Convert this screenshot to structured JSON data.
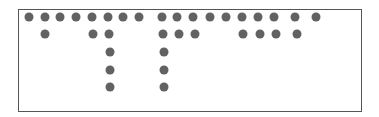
{
  "diagram": {
    "type": "dot-pattern",
    "dot_color": "#626262",
    "border_color": "#555555",
    "dots": [
      {
        "x": 29,
        "y": 17
      },
      {
        "x": 45,
        "y": 17
      },
      {
        "x": 60,
        "y": 17
      },
      {
        "x": 76,
        "y": 17
      },
      {
        "x": 92,
        "y": 17
      },
      {
        "x": 108,
        "y": 17
      },
      {
        "x": 123,
        "y": 17
      },
      {
        "x": 139,
        "y": 17
      },
      {
        "x": 162,
        "y": 17
      },
      {
        "x": 177,
        "y": 17
      },
      {
        "x": 193,
        "y": 17
      },
      {
        "x": 210,
        "y": 17
      },
      {
        "x": 226,
        "y": 17
      },
      {
        "x": 242,
        "y": 17
      },
      {
        "x": 258,
        "y": 17
      },
      {
        "x": 274,
        "y": 17
      },
      {
        "x": 295,
        "y": 17
      },
      {
        "x": 316,
        "y": 17
      },
      {
        "x": 45,
        "y": 34
      },
      {
        "x": 93,
        "y": 34
      },
      {
        "x": 109,
        "y": 34
      },
      {
        "x": 163,
        "y": 34
      },
      {
        "x": 179,
        "y": 34
      },
      {
        "x": 195,
        "y": 34
      },
      {
        "x": 243,
        "y": 34
      },
      {
        "x": 260,
        "y": 34
      },
      {
        "x": 276,
        "y": 34
      },
      {
        "x": 297,
        "y": 34
      },
      {
        "x": 110,
        "y": 52
      },
      {
        "x": 164,
        "y": 52
      },
      {
        "x": 110,
        "y": 70
      },
      {
        "x": 164,
        "y": 70
      },
      {
        "x": 110,
        "y": 87
      },
      {
        "x": 164,
        "y": 87
      }
    ]
  }
}
